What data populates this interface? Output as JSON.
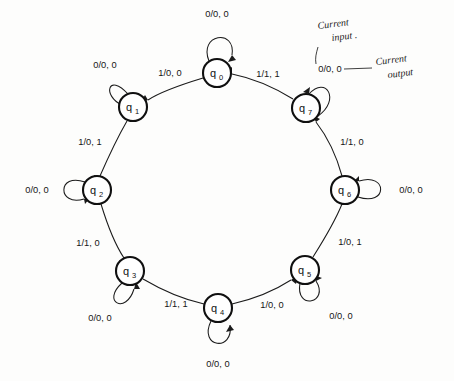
{
  "diagram": {
    "type": "state-machine",
    "geometry": {
      "center_x": 218,
      "center_y": 190,
      "ring_radius": 118,
      "node_radius": 14
    },
    "label_format": "input/output, output",
    "ink_color": "#1b1b1b",
    "paper_color": "#fdfdfc"
  },
  "states": [
    {
      "id": "q0",
      "name": "q",
      "sub": "0",
      "cx": 217,
      "cy": 73
    },
    {
      "id": "q1",
      "name": "q",
      "sub": "1",
      "cx": 133,
      "cy": 107
    },
    {
      "id": "q2",
      "name": "q",
      "sub": "2",
      "cx": 97,
      "cy": 190
    },
    {
      "id": "q3",
      "name": "q",
      "sub": "3",
      "cx": 130,
      "cy": 271
    },
    {
      "id": "q4",
      "name": "q",
      "sub": "4",
      "cx": 218,
      "cy": 308
    },
    {
      "id": "q5",
      "name": "q",
      "sub": "5",
      "cx": 305,
      "cy": 270
    },
    {
      "id": "q6",
      "name": "q",
      "sub": "6",
      "cx": 345,
      "cy": 190
    },
    {
      "id": "q7",
      "name": "q",
      "sub": "7",
      "cx": 306,
      "cy": 108
    }
  ],
  "self_loops": [
    {
      "state": "q0",
      "label": "0/0, 0",
      "label_x": 217,
      "label_y": 17,
      "dir": "up"
    },
    {
      "state": "q1",
      "label": "0/0, 0",
      "label_x": 105,
      "label_y": 68,
      "dir": "upleft"
    },
    {
      "state": "q2",
      "label": "0/0, 0",
      "label_x": 37,
      "label_y": 190,
      "dir": "left"
    },
    {
      "state": "q3",
      "label": "0/0, 0",
      "label_x": 100,
      "label_y": 318,
      "dir": "downleft"
    },
    {
      "state": "q4",
      "label": "0/0, 0",
      "label_x": 218,
      "label_y": 364,
      "dir": "down"
    },
    {
      "state": "q5",
      "label": "0/0, 0",
      "label_x": 340,
      "label_y": 316,
      "dir": "downright"
    },
    {
      "state": "q6",
      "label": "0/0, 0",
      "label_x": 409,
      "label_y": 191,
      "dir": "right"
    },
    {
      "state": "q7",
      "label": "0/0, 0",
      "label_x": 328,
      "label_y": 70,
      "dir": "upright"
    }
  ],
  "transitions": [
    {
      "from": "q0",
      "to": "q1",
      "label": "1/0, 0",
      "label_x": 170,
      "label_y": 73
    },
    {
      "from": "q1",
      "to": "q2",
      "label": "1/0, 1",
      "label_x": 92,
      "label_y": 142
    },
    {
      "from": "q2",
      "to": "q3",
      "label": "1/1, 0",
      "label_x": 89,
      "label_y": 243
    },
    {
      "from": "q3",
      "to": "q4",
      "label": "1/1, 1",
      "label_x": 175,
      "label_y": 304
    },
    {
      "from": "q4",
      "to": "q5",
      "label": "1/0, 0",
      "label_x": 272,
      "label_y": 305
    },
    {
      "from": "q5",
      "to": "q6",
      "label": "1/0, 1",
      "label_x": 348,
      "label_y": 242
    },
    {
      "from": "q6",
      "to": "q7",
      "label": "1/1, 0",
      "label_x": 350,
      "label_y": 142
    },
    {
      "from": "q7",
      "to": "q0",
      "label": "1/1, 1",
      "label_x": 268,
      "label_y": 74
    }
  ],
  "annotations": [
    {
      "id": "current-input",
      "text_line1": "Current",
      "text_line2": "input .",
      "x": 330,
      "y": 28
    },
    {
      "id": "current-output",
      "text_line1": "Current",
      "text_line2": "output",
      "x": 388,
      "y": 62
    }
  ]
}
